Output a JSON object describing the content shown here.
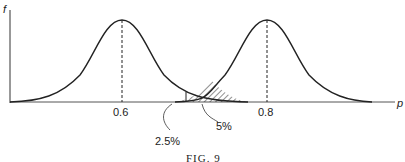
{
  "axes": {
    "y_label": "f",
    "x_label": "p"
  },
  "ticks": [
    {
      "label": "0.6"
    },
    {
      "label": "0.8"
    }
  ],
  "annotations": [
    {
      "label": "2.5%"
    },
    {
      "label": "5%"
    }
  ],
  "caption": "FIG. 9"
}
